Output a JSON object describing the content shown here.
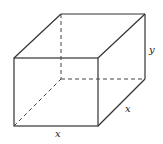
{
  "diagram": {
    "type": "rectangular-prism",
    "labels": {
      "height": "y",
      "depth": "x",
      "width": "x"
    },
    "colors": {
      "stroke": "#333333",
      "background": "#ffffff"
    }
  }
}
